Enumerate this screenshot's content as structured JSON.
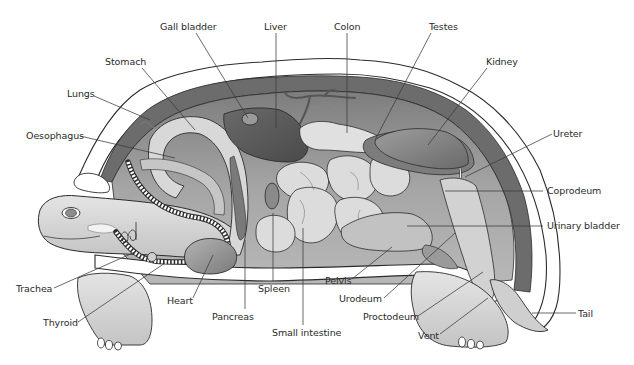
{
  "diagram": {
    "colors": {
      "outline": "#2b2b2b",
      "shell_outer": "#ffffff",
      "shell_band": "#6e6e6e",
      "body_cavity": "#9a9a9a",
      "organ_light": "#dcdcdc",
      "organ_mid": "#bdbdbd",
      "organ_dark": "#5e5e5e",
      "skin": "#d6d6d6",
      "label_text": "#2a2a2a",
      "leader_line": "#3a3a3a"
    }
  },
  "labels": [
    {
      "id": "gall-bladder",
      "text": "Gall bladder",
      "x": 160,
      "y": 21,
      "line": [
        [
          196,
          33
        ],
        [
          248,
          118
        ]
      ]
    },
    {
      "id": "liver",
      "text": "Liver",
      "x": 264,
      "y": 21,
      "line": [
        [
          276,
          33
        ],
        [
          276,
          128
        ]
      ]
    },
    {
      "id": "colon",
      "text": "Colon",
      "x": 334,
      "y": 21,
      "line": [
        [
          347,
          33
        ],
        [
          347,
          133
        ]
      ]
    },
    {
      "id": "testes",
      "text": "Testes",
      "x": 429,
      "y": 21,
      "line": [
        [
          431,
          33
        ],
        [
          375,
          140
        ]
      ]
    },
    {
      "id": "kidney",
      "text": "Kidney",
      "x": 486,
      "y": 56,
      "line": [
        [
          487,
          68
        ],
        [
          428,
          145
        ]
      ]
    },
    {
      "id": "stomach",
      "text": "Stomach",
      "x": 105,
      "y": 56,
      "line": [
        [
          142,
          68
        ],
        [
          195,
          130
        ]
      ]
    },
    {
      "id": "lungs",
      "text": "Lungs",
      "x": 67,
      "y": 88,
      "line": [
        [
          94,
          96
        ],
        [
          150,
          120
        ]
      ]
    },
    {
      "id": "oesophagus",
      "text": "Oesophagus",
      "x": 26,
      "y": 130,
      "line": [
        [
          80,
          136
        ],
        [
          175,
          158
        ]
      ]
    },
    {
      "id": "ureter",
      "text": "Ureter",
      "x": 553,
      "y": 128,
      "line": [
        [
          552,
          134
        ],
        [
          465,
          177
        ]
      ]
    },
    {
      "id": "coprodeum",
      "text": "Coprodeum",
      "x": 547,
      "y": 185,
      "line": [
        [
          543,
          191
        ],
        [
          445,
          191
        ]
      ]
    },
    {
      "id": "urinary-bladder",
      "text": "Urinary bladder",
      "x": 547,
      "y": 220,
      "line": [
        [
          543,
          226
        ],
        [
          407,
          226
        ]
      ]
    },
    {
      "id": "trachea",
      "text": "Trachea",
      "x": 16,
      "y": 283,
      "line": [
        [
          54,
          288
        ],
        [
          135,
          252
        ]
      ]
    },
    {
      "id": "thyroid",
      "text": "Thyroid",
      "x": 43,
      "y": 317,
      "line": [
        [
          78,
          322
        ],
        [
          165,
          263
        ]
      ]
    },
    {
      "id": "heart",
      "text": "Heart",
      "x": 167,
      "y": 295,
      "line": [
        [
          193,
          298
        ],
        [
          213,
          255
        ]
      ]
    },
    {
      "id": "pancreas",
      "text": "Pancreas",
      "x": 212,
      "y": 311,
      "line": [
        [
          245,
          309
        ],
        [
          245,
          240
        ]
      ]
    },
    {
      "id": "spleen",
      "text": "Spleen",
      "x": 258,
      "y": 283,
      "line": [
        [
          273,
          281
        ],
        [
          273,
          213
        ]
      ]
    },
    {
      "id": "small-intestine",
      "text": "Small intestine",
      "x": 272,
      "y": 327,
      "line": [
        [
          303,
          325
        ],
        [
          303,
          228
        ]
      ]
    },
    {
      "id": "pelvis",
      "text": "Pelvis",
      "x": 325,
      "y": 275,
      "line": [
        [
          352,
          279
        ],
        [
          392,
          247
        ]
      ]
    },
    {
      "id": "urodeum",
      "text": "Urodeum",
      "x": 339,
      "y": 293,
      "line": [
        [
          384,
          298
        ],
        [
          455,
          233
        ]
      ]
    },
    {
      "id": "proctodeum",
      "text": "Proctodeum",
      "x": 363,
      "y": 311,
      "line": [
        [
          418,
          316
        ],
        [
          483,
          272
        ]
      ]
    },
    {
      "id": "vent",
      "text": "Vent",
      "x": 418,
      "y": 330,
      "line": [
        [
          440,
          334
        ],
        [
          488,
          298
        ]
      ]
    },
    {
      "id": "tail",
      "text": "Tail",
      "x": 578,
      "y": 308,
      "line": [
        [
          576,
          313
        ],
        [
          532,
          313
        ]
      ]
    }
  ]
}
